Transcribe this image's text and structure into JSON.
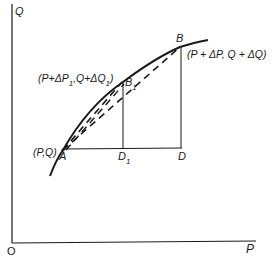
{
  "diagram": {
    "axes": {
      "y_label": "Q",
      "x_label": "P",
      "origin_label": "O"
    },
    "points": {
      "A": {
        "label": "A",
        "coord_label": "(P,Q)"
      },
      "B1": {
        "label": "B",
        "subscript": "1",
        "coord_label_parts": [
          "(P+ΔP",
          "1",
          ",Q+ΔQ",
          "1",
          ")"
        ]
      },
      "B": {
        "label": "B",
        "coord_label": "(P + ΔP, Q + ΔQ)"
      },
      "D1": {
        "label": "D",
        "subscript": "1"
      },
      "D": {
        "label": "D"
      }
    },
    "lines": {
      "curve": "solid curve from below A through A, B1, to beyond B",
      "chord_AB": "dashed",
      "chord_AB1": "dashed",
      "AD": "solid horizontal",
      "B1D1": "solid vertical",
      "BD": "solid vertical"
    },
    "colors": {
      "ink": "#1a1a1a",
      "background": "#ffffff"
    }
  }
}
